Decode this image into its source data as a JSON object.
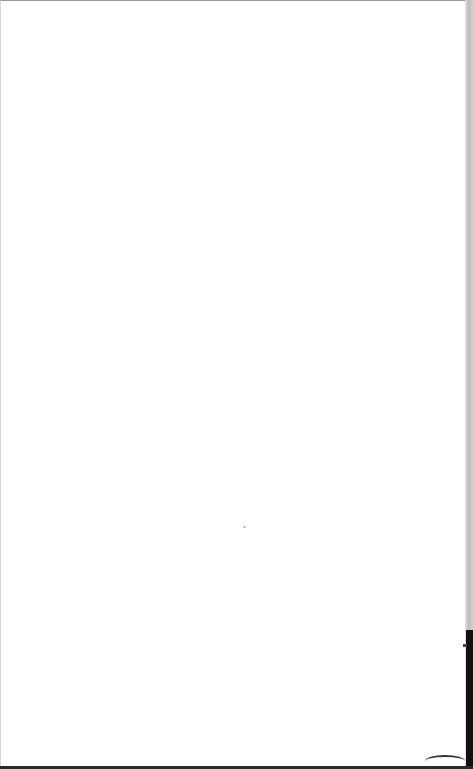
{
  "page": {
    "content": "",
    "background_color": "#ffffff",
    "edge_color": "#111111"
  }
}
